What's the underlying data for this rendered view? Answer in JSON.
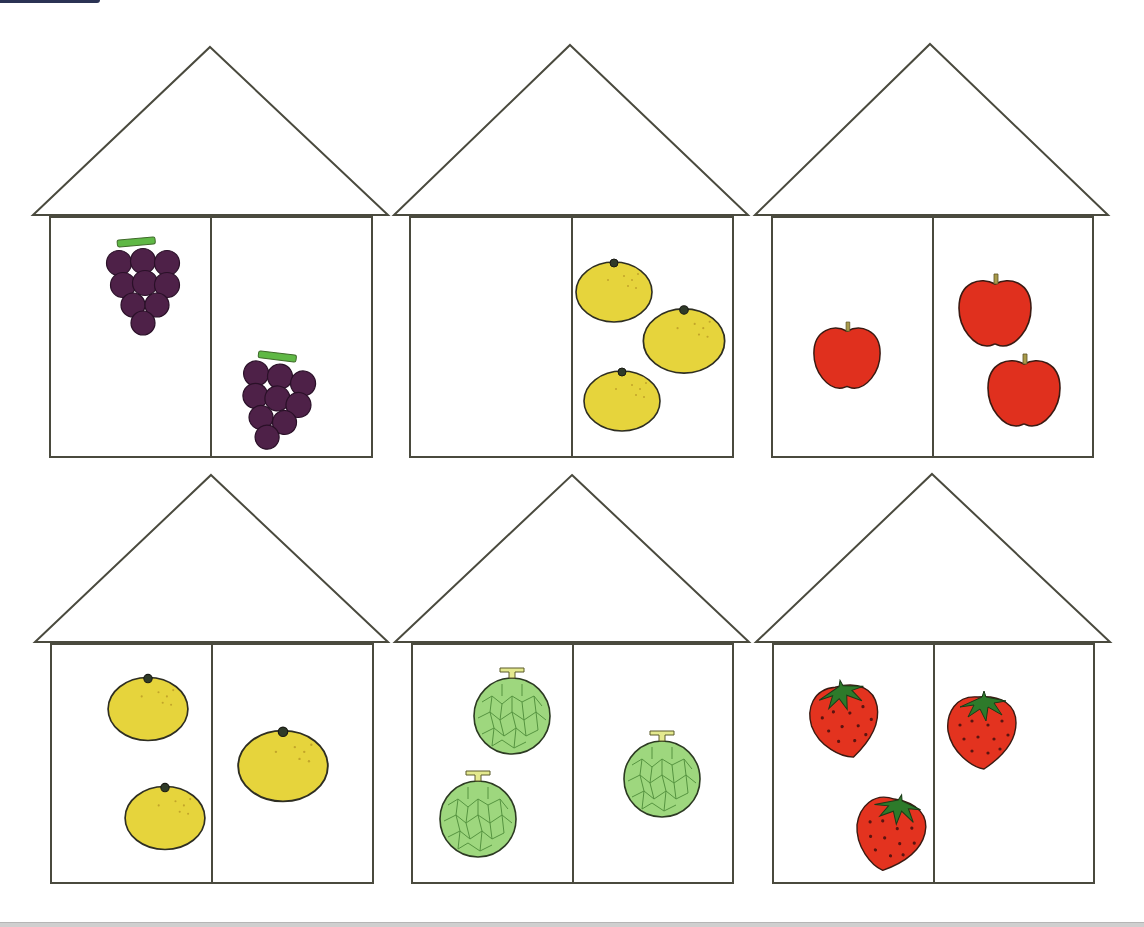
{
  "worksheet": {
    "colors": {
      "outline": "#4a4a3e",
      "grape": "#4e2148",
      "grape_stem": "#5fb845",
      "orange": "#e6d43c",
      "apple": "#e0301e",
      "apple_stem": "#a89a4a",
      "melon": "#9ed77e",
      "melon_net": "#4e8c3a",
      "melon_stem": "#e4e98e",
      "strawberry": "#e3331f",
      "strawberry_leaf": "#2d7a2a"
    },
    "houses": [
      {
        "id": "house-1",
        "fruit": "grape",
        "roof": {
          "apex": [
            210,
            47
          ],
          "left": [
            33,
            215
          ],
          "right": [
            388,
            215
          ]
        },
        "body": {
          "x": 50,
          "y": 217,
          "w": 322,
          "h": 240
        },
        "divider_x": 211,
        "left_room": {
          "count": 1,
          "items": [
            {
              "x": 143,
              "y": 285,
              "s": 1.0,
              "r": 0
            }
          ]
        },
        "right_room": {
          "count": 1,
          "items": [
            {
              "x": 275,
              "y": 400,
              "s": 1.0,
              "r": 12
            }
          ]
        }
      },
      {
        "id": "house-2",
        "fruit": "orange",
        "roof": {
          "apex": [
            570,
            45
          ],
          "left": [
            394,
            215
          ],
          "right": [
            748,
            215
          ]
        },
        "body": {
          "x": 410,
          "y": 217,
          "w": 323,
          "h": 240
        },
        "divider_x": 572,
        "left_room": {
          "count": 0,
          "items": []
        },
        "right_room": {
          "count": 3,
          "items": [
            {
              "x": 614,
              "y": 292,
              "s": 1.0,
              "r": 0
            },
            {
              "x": 684,
              "y": 341,
              "s": 1.07,
              "r": 0
            },
            {
              "x": 622,
              "y": 401,
              "s": 1.0,
              "r": 0
            }
          ]
        }
      },
      {
        "id": "house-3",
        "fruit": "apple",
        "roof": {
          "apex": [
            930,
            44
          ],
          "left": [
            755,
            215
          ],
          "right": [
            1108,
            215
          ]
        },
        "body": {
          "x": 772,
          "y": 217,
          "w": 321,
          "h": 240
        },
        "divider_x": 933,
        "left_room": {
          "count": 1,
          "items": [
            {
              "x": 847,
              "y": 357,
              "s": 0.92,
              "r": 0
            }
          ]
        },
        "right_room": {
          "count": 2,
          "items": [
            {
              "x": 995,
              "y": 312,
              "s": 1.0,
              "r": 0
            },
            {
              "x": 1024,
              "y": 392,
              "s": 1.0,
              "r": 0
            }
          ]
        }
      },
      {
        "id": "house-4",
        "fruit": "orange",
        "roof": {
          "apex": [
            211,
            475
          ],
          "left": [
            35,
            642
          ],
          "right": [
            388,
            642
          ]
        },
        "body": {
          "x": 51,
          "y": 644,
          "w": 322,
          "h": 239
        },
        "divider_x": 212,
        "left_room": {
          "count": 2,
          "items": [
            {
              "x": 148,
              "y": 709,
              "s": 1.05,
              "r": 0
            },
            {
              "x": 165,
              "y": 818,
              "s": 1.05,
              "r": 0
            }
          ]
        },
        "right_room": {
          "count": 1,
          "items": [
            {
              "x": 283,
              "y": 766,
              "s": 1.18,
              "r": 0
            }
          ]
        }
      },
      {
        "id": "house-5",
        "fruit": "melon",
        "roof": {
          "apex": [
            572,
            475
          ],
          "left": [
            395,
            642
          ],
          "right": [
            749,
            642
          ]
        },
        "body": {
          "x": 412,
          "y": 644,
          "w": 321,
          "h": 239
        },
        "divider_x": 573,
        "left_room": {
          "count": 2,
          "items": [
            {
              "x": 512,
              "y": 716,
              "s": 1.0,
              "r": 0
            },
            {
              "x": 478,
              "y": 819,
              "s": 1.0,
              "r": 0
            }
          ]
        },
        "right_room": {
          "count": 1,
          "items": [
            {
              "x": 662,
              "y": 779,
              "s": 1.0,
              "r": 0
            }
          ]
        }
      },
      {
        "id": "house-6",
        "fruit": "strawberry",
        "roof": {
          "apex": [
            932,
            474
          ],
          "left": [
            756,
            642
          ],
          "right": [
            1110,
            642
          ]
        },
        "body": {
          "x": 773,
          "y": 644,
          "w": 321,
          "h": 239
        },
        "divider_x": 934,
        "left_room": {
          "count": 2,
          "items": [
            {
              "x": 845,
              "y": 720,
              "s": 1.0,
              "r": -10
            },
            {
              "x": 890,
              "y": 833,
              "s": 1.0,
              "r": 14
            }
          ]
        },
        "right_room": {
          "count": 1,
          "items": [
            {
              "x": 982,
              "y": 731,
              "s": 1.0,
              "r": 0
            }
          ]
        }
      }
    ]
  }
}
